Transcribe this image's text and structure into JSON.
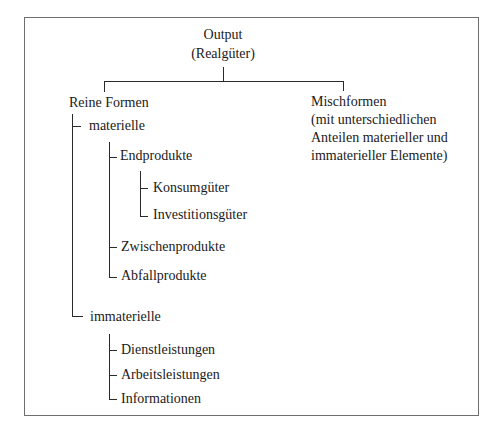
{
  "diagram": {
    "root": {
      "line1": "Output",
      "line2": "(Realgüter)"
    },
    "branches": {
      "reine": {
        "label": "Reine Formen",
        "materielle": {
          "label": "materielle",
          "endprodukte": {
            "label": "Endprodukte",
            "children": [
              "Konsumgüter",
              "Investitionsgüter"
            ]
          },
          "zwischen": "Zwischenprodukte",
          "abfall": "Abfallprodukte"
        },
        "immaterielle": {
          "label": "immaterielle",
          "children": [
            "Dienstleistungen",
            "Arbeitsleistungen",
            "Informationen"
          ]
        }
      },
      "misch": {
        "lines": [
          "Mischformen",
          "(mit unterschiedlichen",
          "Anteilen materieller und",
          "immaterieller Elemente)"
        ]
      }
    },
    "colors": {
      "line": "#2a2a2a",
      "frame": "#6e6e6e",
      "text": "#1a1a1a"
    }
  }
}
